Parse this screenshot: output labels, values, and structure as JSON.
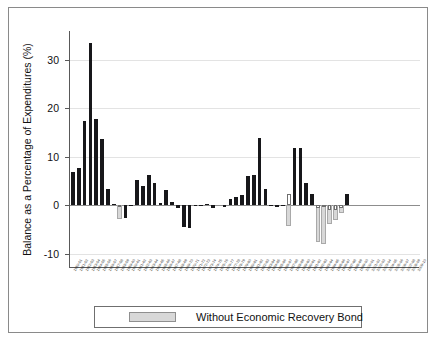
{
  "chart_data": {
    "type": "bar",
    "title": "",
    "xlabel": "",
    "ylabel": "Balance as a Percentage of Expenditures (%)",
    "ylim": [
      -13,
      36
    ],
    "yticks": [
      -10,
      0,
      10,
      20,
      30
    ],
    "ytick_labels": [
      "-10",
      "0",
      "10",
      "20",
      "30"
    ],
    "grid": true,
    "legend_position": "bottom",
    "legend": [
      {
        "name": "Without Economic Recovery Bond",
        "color": "#d8d8d8"
      }
    ],
    "series_colors": {
      "primary": "#17171a",
      "secondary": "#d8d8d8",
      "outline": "#6e6e6e"
    },
    "categories": [
      "1950-51",
      "1951-52",
      "1952-53",
      "1953-54",
      "1954-55",
      "1955-56",
      "1956-57",
      "1957-58",
      "1958-59",
      "1959-60",
      "1960-61",
      "1961-62",
      "1962-63",
      "1963-64",
      "1964-65",
      "1965-66",
      "1966-67",
      "1967-68",
      "1968-69",
      "1969-70",
      "1970-71",
      "1971-72",
      "1972-73",
      "1973-74",
      "1974-75",
      "1975-76",
      "1976-77",
      "1977-78",
      "1978-79",
      "1979-80",
      "1980-81",
      "1981-82",
      "1982-83",
      "1983-84",
      "1984-85",
      "1985-86",
      "1986-87",
      "1987-88",
      "1988-89",
      "1989-90",
      "1990-91",
      "1991-92",
      "1992-93",
      "1993-94",
      "1994-95",
      "1995-96",
      "1996-97",
      "1997-98",
      "1998-99",
      "1999-00",
      "2000-01",
      "2001-02",
      "2002-03",
      "2003-04",
      "2004-05",
      "2005-06",
      "2006-07",
      "2007-08",
      "2008-09",
      "2009-10"
    ],
    "series": [
      {
        "name": "Reserve Balance",
        "color": "#17171a",
        "values": [
          6.8,
          7.6,
          17.4,
          33.6,
          17.9,
          13.7,
          3.3,
          0.2,
          -0.1,
          -2.6,
          0.1,
          5.1,
          4.0,
          6.2,
          4.6,
          0.4,
          3.1,
          0.6,
          -0.5,
          -4.6,
          -4.8,
          -0.2,
          0.1,
          0.3,
          -0.5,
          0.0,
          -0.4,
          1.2,
          1.6,
          2.1,
          6.0,
          6.3,
          13.9,
          3.4,
          0.1,
          -0.4,
          0.1,
          2.2,
          11.9,
          11.8,
          4.5,
          2.3,
          -0.6,
          -0.4,
          -1.0,
          -1.1,
          -0.5,
          2.2,
          0.0,
          0.0,
          0.0,
          0.0,
          0.0,
          0.0,
          0.0,
          0.0,
          0.0,
          0.0,
          0.0,
          0.0
        ]
      },
      {
        "name": "Without Economic Recovery Bond",
        "color": "#d8d8d8",
        "values": [
          0,
          0,
          0,
          0,
          0,
          0,
          0,
          0,
          -2.9,
          0,
          0,
          0,
          0,
          0,
          0,
          0,
          0,
          0,
          0,
          0,
          0,
          0,
          0,
          0,
          0,
          0,
          0,
          0,
          0,
          0,
          0,
          0,
          0,
          0,
          0,
          0,
          0,
          -4.3,
          0,
          0,
          0,
          0,
          -7.7,
          -8.1,
          -4.0,
          -3.0,
          -1.7,
          0,
          0,
          0,
          0,
          0,
          0,
          0,
          0,
          0,
          0,
          0,
          0,
          0
        ]
      }
    ]
  }
}
